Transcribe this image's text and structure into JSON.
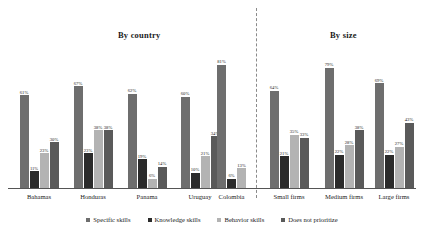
{
  "chart_data": {
    "type": "bar",
    "title": "",
    "xlabel": "",
    "ylabel": "",
    "ylim": [
      0,
      100
    ],
    "grid": false,
    "legend_position": "bottom",
    "panels": [
      {
        "title": "By country",
        "categories": [
          "Bahamas",
          "Honduras",
          "Panama",
          "Uruguay",
          "Colombia"
        ]
      },
      {
        "title": "By size",
        "categories": [
          "Small firms",
          "Medium firms",
          "Large firms"
        ]
      }
    ],
    "categories": [
      "Bahamas",
      "Honduras",
      "Panama",
      "Uruguay",
      "Colombia",
      "Small firms",
      "Medium firms",
      "Large firms"
    ],
    "series": [
      {
        "name": "Specific skills",
        "color": "#6e6e6e",
        "values": [
          61,
          67,
          62,
          60,
          81,
          64,
          79,
          69
        ],
        "labels": [
          "61%",
          "67%",
          "62%",
          "60%",
          "81%",
          "64%",
          "79%",
          "69%"
        ]
      },
      {
        "name": "Knowledge skills",
        "color": "#2b2b2b",
        "values": [
          11,
          23,
          19,
          10,
          6,
          21,
          22,
          22
        ],
        "labels": [
          "11%",
          "23%",
          "19%",
          "10%",
          "6%",
          "21%",
          "22%",
          "22%"
        ]
      },
      {
        "name": "Behavior skills",
        "color": "#b3b3b3",
        "values": [
          23,
          38,
          6,
          21,
          13,
          35,
          28,
          27
        ],
        "labels": [
          "23%",
          "38%",
          "6%",
          "21%",
          "13%",
          "35%",
          "28%",
          "27%"
        ]
      },
      {
        "name": "Does not prioritize",
        "color": "#5a5a5a",
        "values": [
          30,
          38,
          14,
          34,
          0,
          33,
          38,
          43
        ],
        "labels": [
          "30%",
          "38%",
          "14%",
          "34%",
          "",
          "33%",
          "38%",
          "43%"
        ]
      }
    ]
  },
  "legend": {
    "items": [
      {
        "label": "Specific skills",
        "color": "#6e6e6e"
      },
      {
        "label": "Knowledge skills",
        "color": "#2b2b2b"
      },
      {
        "label": "Behavior skills",
        "color": "#b3b3b3"
      },
      {
        "label": "Does not prioritize",
        "color": "#5a5a5a"
      }
    ]
  }
}
